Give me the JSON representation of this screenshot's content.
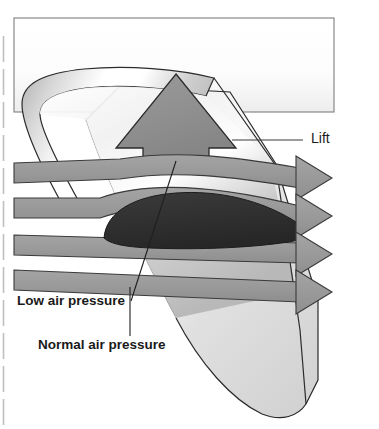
{
  "figure": {
    "type": "diagram",
    "callouts": [
      {
        "id": "lift",
        "label": "Lift",
        "x": 311,
        "y": 143,
        "font_size": 14,
        "bold": false,
        "leader": {
          "x1": 232,
          "y1": 140,
          "x2": 303,
          "y2": 140
        }
      },
      {
        "id": "low-air-pressure",
        "label": "Low air pressure",
        "x": 17,
        "y": 305,
        "font_size": 13,
        "bold": true,
        "leader": {
          "x1": 131,
          "y1": 301,
          "x2": 176,
          "y2": 161
        }
      },
      {
        "id": "normal-air-pressure",
        "label": "Normal air pressure",
        "x": 38,
        "y": 349,
        "font_size": 13,
        "bold": true,
        "leader": {
          "x1": 130,
          "y1": 336,
          "x2": 130,
          "y2": 287
        }
      }
    ],
    "colors": {
      "airflow_band": "#9a9a9a",
      "airflow_band_stroke": "#3a3a3a",
      "lift_arrow": "#8f8f8f",
      "lift_arrow_stroke": "#2b2b2b",
      "airfoil_dark": "#333333",
      "wing_light": "#d8d8d8",
      "wing_highlight": "#ffffff",
      "outline": "#2b2b2b",
      "frame_border": "#7a7a7a",
      "page_edge": "#b8b8b8",
      "text": "#1a1a1a",
      "background": "#ffffff"
    },
    "airflow": {
      "band_count": 4,
      "description": "Four horizontal airflow bands flowing left to right; the upper two deflect over the curved airfoil, the lower two pass straight beneath.",
      "left_edge_y": [
        163,
        198,
        235,
        270
      ],
      "band_thickness": 20,
      "arrowhead_count": 4
    },
    "frame": {
      "x": 14,
      "y": 18,
      "width": 320,
      "height": 94
    },
    "page_edge_line": {
      "x": 3,
      "y_top": 36,
      "y_bottom": 429
    }
  }
}
